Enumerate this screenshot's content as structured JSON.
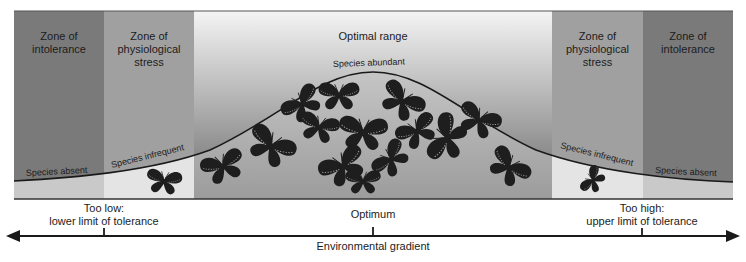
{
  "zones": [
    {
      "id": "intolerance-left",
      "label_lines": [
        "Zone of",
        "intolerance"
      ],
      "color": "#7a7a7a"
    },
    {
      "id": "stress-left",
      "label_lines": [
        "Zone of",
        "physiological",
        "stress"
      ],
      "color": "#a0a0a0"
    },
    {
      "id": "optimal",
      "label_lines": [
        "Optimal range"
      ],
      "color_top": "#f2f2f2",
      "color_bottom": "#6e6e6e"
    },
    {
      "id": "stress-right",
      "label_lines": [
        "Zone of",
        "physiological",
        "stress"
      ],
      "color": "#a0a0a0"
    },
    {
      "id": "intolerance-right",
      "label_lines": [
        "Zone of",
        "intolerance"
      ],
      "color": "#7a7a7a"
    }
  ],
  "curve_labels": {
    "absent_left": "Species absent",
    "infrequent_left": "Species infrequent",
    "abundant": "Species abundant",
    "infrequent_right": "Species infrequent",
    "absent_right": "Species absent"
  },
  "markers": {
    "low": {
      "line1": "Too low:",
      "line2": "lower limit of tolerance"
    },
    "optimum": {
      "line1": "Optimum"
    },
    "high": {
      "line1": "Too high:",
      "line2": "upper limit of tolerance"
    }
  },
  "axis": {
    "label": "Environmental gradient"
  },
  "colors": {
    "intolerance": "#7a7a7a",
    "stress": "#a0a0a0",
    "under_curve_intolerance": "#c9c9c9",
    "under_curve_stress": "#e2e2e2",
    "under_curve_optimal": "#bdbdbd",
    "butterfly": "#1e1e1e",
    "axis": "#1a1a1a"
  }
}
